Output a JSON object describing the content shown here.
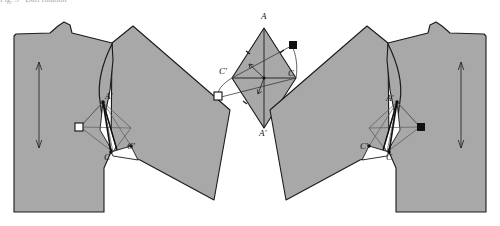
{
  "figure": {
    "type": "technical-pattern-diagram",
    "background_color": "#ffffff",
    "piece_fill_color": "#a8a8a8",
    "outline_color": "#1a1a1a",
    "construction_line_color": "#4a4a4a",
    "marker_black_color": "#111111",
    "marker_white_color": "#ffffff",
    "cut_wedge_color": "#ffffff"
  },
  "top_caption": {
    "text": "Fig. 5 · Dart rotation",
    "note": "clipped text row at very top edge of the scan"
  },
  "left_piece": {
    "name": "left-pattern-piece",
    "labels": [
      {
        "id": "A-prime",
        "text": "A'",
        "x": 105,
        "y": 98
      },
      {
        "id": "C",
        "text": "C",
        "x": 104,
        "y": 159
      },
      {
        "id": "C-prime",
        "text": "C'",
        "x": 127,
        "y": 148
      }
    ],
    "markers": [
      {
        "id": "white-square",
        "kind": "square-open",
        "x": 79,
        "y": 127
      },
      {
        "id": "notch-dot-a",
        "kind": "dot",
        "x": 103,
        "y": 103
      },
      {
        "id": "notch-dot-c",
        "kind": "dot",
        "x": 111,
        "y": 152
      }
    ],
    "grainline": {
      "id": "grainline-arrow",
      "x": 39,
      "y1": 62,
      "y2": 148
    }
  },
  "center_piece": {
    "name": "center-rhombus-construction",
    "labels": [
      {
        "id": "A",
        "text": "A",
        "x": 261,
        "y": 18
      },
      {
        "id": "A-prime",
        "text": "A'",
        "x": 259,
        "y": 135
      },
      {
        "id": "C-left",
        "text": "C'",
        "x": 221,
        "y": 73
      },
      {
        "id": "C-right",
        "text": "C",
        "x": 288,
        "y": 75
      }
    ],
    "markers": [
      {
        "id": "black-square",
        "kind": "square-filled",
        "x": 293,
        "y": 45
      },
      {
        "id": "white-square",
        "kind": "square-open",
        "x": 218,
        "y": 96
      }
    ],
    "vertices": {
      "A": {
        "x": 264,
        "y": 28
      },
      "A_prime": {
        "x": 264,
        "y": 128
      },
      "C_left": {
        "x": 232,
        "y": 78
      },
      "C_right": {
        "x": 296,
        "y": 78
      }
    }
  },
  "right_piece": {
    "name": "right-pattern-piece",
    "labels": [
      {
        "id": "A-prime",
        "text": "A'",
        "x": 388,
        "y": 100
      },
      {
        "id": "C-prime",
        "text": "C'",
        "x": 362,
        "y": 148
      },
      {
        "id": "C",
        "text": "C",
        "x": 385,
        "y": 159
      }
    ],
    "markers": [
      {
        "id": "black-square",
        "kind": "square-filled",
        "x": 417,
        "y": 127
      },
      {
        "id": "notch-dot-a",
        "kind": "dot",
        "x": 396,
        "y": 103
      },
      {
        "id": "notch-dot-c",
        "kind": "dot",
        "x": 377,
        "y": 152
      }
    ],
    "grainline": {
      "id": "grainline-arrow",
      "x": 460,
      "y1": 62,
      "y2": 148
    }
  },
  "legend": {
    "black_square_means": "matched point (closed dart leg)",
    "white_square_means": "matched point (open dart leg)"
  }
}
